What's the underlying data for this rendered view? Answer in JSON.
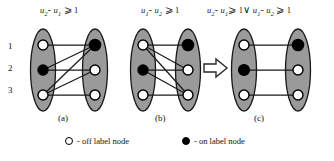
{
  "figure": {
    "row_labels": [
      "1",
      "2",
      "3"
    ],
    "panels": [
      {
        "id": "a",
        "caption": "(a)",
        "constraint": {
          "lhs_var1": "u",
          "lhs_sub1": "2",
          "minus": "-",
          "lhs_var2": "u",
          "lhs_sub2": "1",
          "relation": "⩾",
          "value": "1"
        },
        "left_nodes": [
          "off",
          "on",
          "off"
        ],
        "right_nodes": [
          "on",
          "off",
          "off"
        ],
        "edges": [
          {
            "from": 1,
            "to": 1
          },
          {
            "from": 2,
            "to": 2
          },
          {
            "from": 3,
            "to": 3
          },
          {
            "from": 2,
            "to": 1
          },
          {
            "from": 3,
            "to": 1
          },
          {
            "from": 3,
            "to": 2
          }
        ]
      },
      {
        "id": "b",
        "caption": "(b)",
        "constraint": {
          "lhs_var1": "u",
          "lhs_sub1": "1",
          "minus": "-",
          "lhs_var2": "u",
          "lhs_sub2": "2",
          "relation": "⩾",
          "value": "1"
        },
        "left_nodes": [
          "off",
          "on",
          "off"
        ],
        "right_nodes": [
          "on",
          "off",
          "off"
        ],
        "edges": [
          {
            "from": 1,
            "to": 1
          },
          {
            "from": 2,
            "to": 2
          },
          {
            "from": 3,
            "to": 3
          },
          {
            "from": 1,
            "to": 2
          },
          {
            "from": 1,
            "to": 3
          },
          {
            "from": 2,
            "to": 3
          }
        ]
      },
      {
        "id": "c",
        "caption": "(c)",
        "constraint": {
          "lhs_var1": "u",
          "lhs_sub1": "2",
          "minus": "-",
          "lhs_var2": "u",
          "lhs_sub2": "1",
          "relation": "⩾",
          "value": "1",
          "connective": "∨",
          "rhs_var1": "u",
          "rhs_sub1": "1",
          "rhs_minus": "-",
          "rhs_var2": "u",
          "rhs_sub2": "2",
          "rhs_relation": "⩾",
          "rhs_value": "1"
        },
        "left_nodes": [
          "off",
          "on",
          "off"
        ],
        "right_nodes": [
          "on",
          "off",
          "off"
        ],
        "edges": [
          {
            "from": 1,
            "to": 1
          },
          {
            "from": 2,
            "to": 2
          },
          {
            "from": 3,
            "to": 3
          }
        ]
      }
    ],
    "arrow": {
      "name": "implies-arrow",
      "glyph": "⇨"
    },
    "legend": [
      {
        "marker": "off",
        "text": "- off label node"
      },
      {
        "marker": "on",
        "text": "- on label node"
      }
    ],
    "colors": {
      "ellipse_fill": "#9a9a9a",
      "ellipse_stroke": "#1a1a1a",
      "node_on": "#000000",
      "node_off": "#ffffff",
      "edge": "#1a1a1a",
      "background": "#ffffff"
    }
  }
}
